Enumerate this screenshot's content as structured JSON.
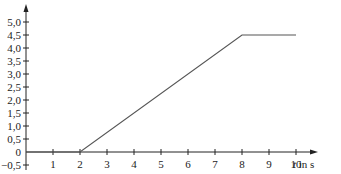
{
  "chart_data": {
    "type": "line",
    "title": "",
    "xlabel": "t in s",
    "xlabel_italic_part": "t",
    "xlabel_rest": " in s",
    "ylabel": "",
    "x_ticks": [
      "1",
      "2",
      "3",
      "4",
      "5",
      "6",
      "7",
      "8",
      "9",
      "10"
    ],
    "y_ticks": [
      "5,0",
      "4,5",
      "4,0",
      "3,5",
      "3,0",
      "2,5",
      "2,0",
      "1,5",
      "1,0",
      "0,5",
      "0",
      "−0,5"
    ],
    "xlim": [
      0,
      10.6
    ],
    "ylim": [
      -0.6,
      5.3
    ],
    "grid": false,
    "series": [
      {
        "name": "line",
        "x": [
          0,
          2,
          8,
          10
        ],
        "y": [
          0,
          0,
          4.5,
          4.5
        ]
      }
    ],
    "line_color": "#555555",
    "axis_color": "#222222"
  }
}
